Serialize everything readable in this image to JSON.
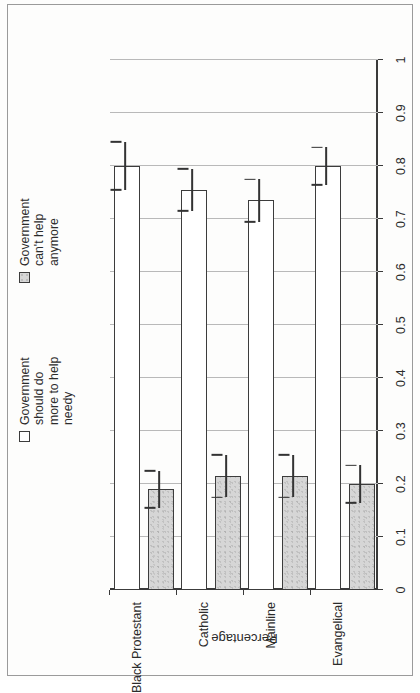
{
  "chart_data": {
    "type": "bar",
    "orientation": "horizontal",
    "title": "",
    "xlabel": "",
    "ylabel": "Percentage",
    "categories": [
      "Evangelical",
      "Mainline",
      "Catholic",
      "Black Protestant"
    ],
    "value_axis": {
      "min": 0,
      "max": 1,
      "step": 0.1,
      "tick_labels": [
        "0",
        "0.1",
        "0.2",
        "0.3",
        "0.4",
        "0.5",
        "0.6",
        "0.7",
        "0.8",
        "0.9",
        "1"
      ],
      "tick_values": [
        0,
        0.1,
        0.2,
        0.3,
        0.4,
        0.5,
        0.6,
        0.7,
        0.8,
        0.9,
        1
      ]
    },
    "grid": true,
    "legend_position": "top-right",
    "series": [
      {
        "name": "Government should do more to help needy",
        "fill": "#ffffff",
        "values": [
          0.8,
          0.735,
          0.755,
          0.8
        ],
        "err_low": [
          0.765,
          0.695,
          0.715,
          0.755
        ],
        "err_high": [
          0.835,
          0.775,
          0.795,
          0.845
        ]
      },
      {
        "name": "Government can't help anymore",
        "fill": "#d6d6d6",
        "values": [
          0.2,
          0.215,
          0.215,
          0.19
        ],
        "err_low": [
          0.165,
          0.175,
          0.175,
          0.155
        ],
        "err_high": [
          0.235,
          0.255,
          0.255,
          0.225
        ]
      }
    ]
  },
  "legend": {
    "entries": [
      {
        "label": "Government\nshould do\nmore to help\nneedy",
        "swatch": "white-square"
      },
      {
        "label": "Government\ncan't help\nanymore",
        "swatch": "gray-square"
      }
    ]
  },
  "axis_titles": {
    "percentage": "Percentage"
  }
}
